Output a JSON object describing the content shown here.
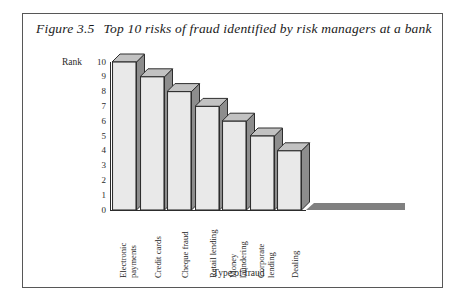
{
  "figure": {
    "number": "Figure 3.5",
    "title": "Top 10 risks of fraud identified by risk managers at a bank",
    "border_color": "#575757"
  },
  "chart_data": {
    "type": "bar",
    "title": "Top 10 risks of fraud identified by risk managers at a bank",
    "xlabel": "Type of fraud",
    "ylabel": "Rank",
    "categories": [
      "Electronic payments",
      "Credit cards",
      "Cheque fraud",
      "Retail lending",
      "Money laundering",
      "Corporate lending",
      "Dealing"
    ],
    "category_lines": [
      [
        "Electronic",
        "payments"
      ],
      [
        "Credit cards",
        ""
      ],
      [
        "Cheque fraud",
        ""
      ],
      [
        "Retail lending",
        ""
      ],
      [
        "Money",
        "laundering"
      ],
      [
        "Corporate",
        "lending"
      ],
      [
        "Dealing",
        ""
      ]
    ],
    "values": [
      10,
      9,
      8,
      7,
      6,
      5,
      4
    ],
    "ylim": [
      0,
      10
    ],
    "yticks": [
      "10",
      "9",
      "8",
      "7",
      "6",
      "5",
      "4",
      "3",
      "2",
      "1",
      "0"
    ],
    "ytick_values": [
      10,
      9,
      8,
      7,
      6,
      5,
      4,
      3,
      2,
      1,
      0
    ],
    "grid": false,
    "legend": "none",
    "style": "3d",
    "colors": {
      "bar_front": "#e9e9e9",
      "bar_side": "#8d8d8d",
      "bar_top": "#c2c2c2",
      "bar_outline": "#2e2e2e",
      "floor": "#808080",
      "axis": "#2a2a2a",
      "text": "#262626"
    }
  }
}
